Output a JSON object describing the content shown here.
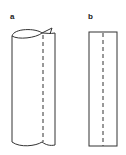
{
  "figure": {
    "panels": [
      {
        "label": "a",
        "description": "rolled sheet forming a cylinder with dashed seam line"
      },
      {
        "label": "b",
        "description": "flat sheet rectangle with dashed fold line"
      }
    ],
    "colors": {
      "stroke": "#333333",
      "background": "#ffffff"
    }
  }
}
